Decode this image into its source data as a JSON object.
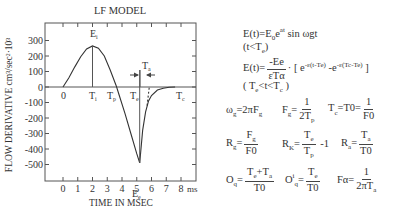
{
  "chart_data": {
    "type": "line",
    "title": "LF MODEL",
    "xlabel": "TIME IN MSEC",
    "ylabel": "FLOW DERIVATIVE cm³/sec²·10³",
    "x_unit": "ms",
    "xlim": [
      -1.2,
      9.0
    ],
    "ylim": [
      -600,
      380
    ],
    "x_ticks": [
      0,
      1,
      2,
      3,
      4,
      5,
      6,
      7,
      8
    ],
    "y_ticks": [
      300,
      200,
      100,
      0,
      -100,
      -200,
      -300,
      -400,
      -500
    ],
    "grid": false,
    "series": [
      {
        "name": "LF model flow derivative (open phase, t<Te)",
        "style": "solid",
        "x": [
          0.0,
          0.4,
          0.8,
          1.2,
          1.6,
          2.0,
          2.4,
          2.8,
          3.2,
          3.6,
          3.8,
          4.2,
          4.6,
          5.0,
          5.2
        ],
        "y": [
          0,
          60,
          130,
          195,
          245,
          265,
          250,
          200,
          110,
          10,
          -50,
          -170,
          -300,
          -430,
          -490
        ]
      },
      {
        "name": "Return phase (Te<t<Tc)",
        "style": "solid",
        "x": [
          5.2,
          5.4,
          5.6,
          5.8,
          6.0,
          6.4,
          6.8,
          7.2,
          7.6
        ],
        "y": [
          -490,
          -280,
          -160,
          -90,
          -55,
          -20,
          -8,
          -2,
          0
        ]
      },
      {
        "name": "Return phase tangent",
        "style": "dashed",
        "x": [
          5.7,
          5.85
        ],
        "y": [
          -120,
          0
        ]
      }
    ],
    "annotations": [
      {
        "label": "Ei",
        "x": 2.0,
        "y": 265,
        "note": "peak, vertical line to axis at Ti"
      },
      {
        "label": "Ee",
        "x": 5.2,
        "y": -490,
        "note": "negative peak, vertical line at Te"
      },
      {
        "label": "0",
        "x": 0.0,
        "y": 0
      },
      {
        "label": "Ti",
        "x": 2.0,
        "y": 0
      },
      {
        "label": "Tp",
        "x": 3.4,
        "y": 0
      },
      {
        "label": "Te",
        "x": 5.2,
        "y": 0
      },
      {
        "label": "Ta",
        "x": 5.5,
        "y": 70,
        "note": "interval between Te and tangent crossing, arrows"
      },
      {
        "label": "Tc",
        "x": 7.6,
        "y": 0
      }
    ]
  },
  "labels": {
    "title": "LF MODEL",
    "xlabel": "TIME IN MSEC",
    "ylabel": "FLOW DERIVATIVE cm³/sec²·10³",
    "x_unit": "ms",
    "ei": "E",
    "ei_sub": "i",
    "ee": "E",
    "ee_sub": "e",
    "zero": "0",
    "ti": "T",
    "ti_sub": "i",
    "tp": "T",
    "tp_sub": "p",
    "te": "T",
    "te_sub": "e",
    "ta": "T",
    "ta_sub": "a",
    "tc": "T",
    "tc_sub": "c"
  },
  "equations": {
    "eq1": "E(t)=E",
    "eq1_sub": "0",
    "eq1_mid": "e",
    "eq1_sup": "at",
    "eq1_end": " sin ωgt",
    "cond1": "(t<T",
    "cond1_sub": "e",
    "cond1_end": ")",
    "eq2_lhs": "E(t)=",
    "eq2_num": "-Ee",
    "eq2_den": "εTα",
    "eq2_rhs": "· [ e",
    "eq2_sup1": "-ε(t-Te)",
    "eq2_mid": " -e",
    "eq2_sup2": "-ε(Tc-Te)",
    "eq2_end": " ]",
    "cond2": "( T",
    "cond2_sub1": "e",
    "cond2_mid": "<t<T",
    "cond2_sub2": "c",
    "cond2_end": " )",
    "wg_lhs": "ω",
    "wg_sub": "g",
    "wg_rhs": "=2πF",
    "wg_rhs_sub": "g",
    "fg_lhs": "F",
    "fg_sub": "g",
    "fg_eq": "=",
    "fg_num": "1",
    "fg_den": "2T",
    "fg_den_sub": "p",
    "tc_lhs": "T",
    "tc_sub": "c",
    "tc_eq": "=T0=",
    "tc_num": "1",
    "tc_den": "F0",
    "rg_lhs": "R",
    "rg_sub": "g",
    "rg_eq": "=",
    "rg_num": "F",
    "rg_num_sub": "g",
    "rg_den": "F0",
    "rk_lhs": "R",
    "rk_sub": "K",
    "rk_eq": "=",
    "rk_num": "T",
    "rk_num_sub": "e",
    "rk_den": "T",
    "rk_den_sub": "p",
    "rk_tail": " -1",
    "ra_lhs": "R",
    "ra_sub": "a",
    "ra_eq": "=",
    "ra_num": "T",
    "ra_num_sub": "a",
    "ra_den": "T0",
    "oq_lhs": "O",
    "oq_sub": "q",
    "oq_eq": "=",
    "oq_num": "T",
    "oq_num_sub1": "e",
    "oq_num_mid": "+T",
    "oq_num_sub2": "a",
    "oq_den": "T0",
    "oqi_lhs": "O",
    "oqi_sup": "i",
    "oqi_sub": "q",
    "oqi_eq": "=",
    "oqi_num": "T",
    "oqi_num_sub": "e",
    "oqi_den": "T0",
    "fa_lhs": "Fα=",
    "fa_num": "1",
    "fa_den": "2πT",
    "fa_den_sub": "a"
  }
}
